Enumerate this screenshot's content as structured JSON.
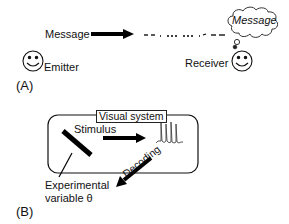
{
  "panel_a": {
    "label": "(A)",
    "message_label": "Message",
    "emitter_label": "Emitter",
    "receiver_label": "Receiver",
    "cloud_text": "Message"
  },
  "panel_b": {
    "label": "(B)",
    "system_label": "Visual system",
    "stimulus_label": "Stimulus",
    "variable_line1": "Experimental",
    "variable_line2": "variable θ",
    "decoding_label": "Decoding"
  }
}
